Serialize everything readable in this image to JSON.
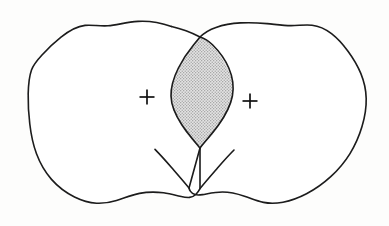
{
  "figure": {
    "title": "Two overlapping irregular regions with shaded intersection",
    "background_color": "#fdfdfc",
    "stroke_color": "#1a1a1a",
    "stroke_width": 1.6,
    "fill_color": "#ffffff",
    "intersection_fill_color": "#d8d8d8",
    "intersection_stipple_color": "#9a9a9a",
    "marker_color": "#111111",
    "width": 389,
    "height": 226
  },
  "regions": [
    {
      "id": "left-region",
      "label": "Left region",
      "center_marker": {
        "x": 147,
        "y": 97,
        "glyph": "+",
        "size": 15
      },
      "bounds": {
        "x_min": 28,
        "x_max": 233,
        "y_min": 21,
        "y_max": 205
      }
    },
    {
      "id": "right-region",
      "label": "Right region",
      "center_marker": {
        "x": 250,
        "y": 101,
        "glyph": "+",
        "size": 15
      },
      "bounds": {
        "x_min": 171,
        "x_max": 366,
        "y_min": 22,
        "y_max": 206
      }
    }
  ],
  "intersection": {
    "id": "intersection-lens",
    "label": "Shaded intersection lens",
    "shaded": true,
    "top_crossing": {
      "x": 200,
      "y": 37
    },
    "bottom_crossing": {
      "x": 200,
      "y": 148
    },
    "x_min": 171,
    "x_max": 233
  },
  "markers": [
    {
      "id": "left-center-cross",
      "name": "plus",
      "glyph": "+",
      "x": 147,
      "y": 97
    },
    {
      "id": "right-center-cross",
      "name": "plus",
      "glyph": "+",
      "x": 250,
      "y": 101
    }
  ],
  "paths": {
    "left_outline": "M 171.5 26.5 C 160 22.5 148 20.8 138 21.4 C 126 22.1 117 25.2 108 25.8 C 99 26.4 92 24.6 85 25.4 C 76 26.4 68 31.6 61 37.2 C 53.5 43.2 47 49.5 42 55.0 C 37 60.4 33.5 64.4 31.5 70.0 C 29.2 76.4 28.4 84.8 28.2 94.0 C 28.0 103.6 28.6 114.0 29.8 124.0 C 31.0 134.4 33.0 144.4 36.5 153.8 C 40.0 163.2 45.0 172.0 51.5 179.4 C 58.0 186.8 66.0 192.8 74.5 197.0 C 82.0 200.7 89.5 202.8 96.5 203.2 C 103.5 203.6 110.0 202.4 116.5 200.4 C 124.0 198.1 131.5 195.0 139.5 193.4 C 147.5 191.8 156.0 191.8 163.5 192.8 C 170.0 193.7 175.5 195.2 180.0 196.2 C 184.0 197.1 187.0 197.6 189.5 197.4 C 192.0 197.2 194.0 196.2 196.0 194.2 C 198.2 192.0 200.0 188.6 200.0 188.6 L 200.0 148.0",
    "left_lens_edge": "M 200.0 148.0 C 204.5 142.0 212.0 134.0 218.5 125.0 C 225.0 116.0 230.5 106.0 232.4 96.0 C 234.2 86.4 232.6 76.8 228.8 68.0 C 225.0 59.2 219.0 51.2 212.5 44.8 C 206.5 38.9 200.0 37.0 200.0 37.0 C 200.0 37.0 193.0 33.4 186.0 30.8 C 181.2 29.0 176.0 27.5 171.5 26.5",
    "right_outline": "M 200.0 37.0 C 204.0 33.0 209.5 29.6 216.0 27.4 C 223.5 24.8 232.0 23.4 240.5 22.9 C 249.5 22.4 258.5 22.8 267.0 23.6 C 275.5 24.4 283.5 25.6 291.0 25.6 C 298.5 25.6 305.5 24.4 312.0 25.2 C 319.0 26.0 325.5 29.0 331.5 33.6 C 337.5 38.2 343.0 44.4 348.0 51.2 C 353.0 58.0 357.5 65.4 360.8 73.4 C 364.0 81.2 366.0 89.6 366.2 98.4 C 366.4 107.6 364.8 117.2 362.0 126.6 C 359.2 136.0 355.2 145.2 350.0 153.6 C 344.8 162.0 338.4 169.6 331.0 176.4 C 323.6 183.2 315.2 189.2 306.5 193.8 C 298.5 198.0 290.5 200.8 283.0 202.2 C 276.0 203.5 269.5 203.6 263.5 202.4 C 257.0 201.1 251.0 198.4 244.5 196.2 C 237.5 193.8 230.0 192.0 222.5 192.0 C 215.0 192.0 207.5 193.8 202.5 194.6 C 199.5 195.1 197.0 195.2 195.0 194.6 C 193.0 194.0 191.5 192.8 190.5 191.4 C 189.4 189.8 189.0 188.0 189.0 188.0 L 200.0 148.0",
    "right_lens_edge": "M 200.0 148.0 C 195.0 142.0 188.0 134.0 182.0 125.0 C 176.0 116.0 171.2 106.0 171.0 96.0 C 170.8 86.4 174.0 76.8 178.4 68.0 C 182.8 59.2 188.4 51.2 193.5 45.0 C 196.8 41.0 200.0 37.0 200.0 37.0",
    "left_tail": "M 189.0 188.0 C 185.0 183.0 178.0 175.0 171.5 167.5 C 165.0 160.0 159.0 153.5 155.0 149.4",
    "right_tail": "M 200.0 188.6 C 204.0 183.5 211.0 175.5 217.5 168.0 C 224.0 160.5 230.0 154.0 234.0 150.0",
    "lens": "M 200.0 37.0 C 196.8 41.0 193.5 45.0 189.0 51.2 C 184.0 58.2 178.8 67.0 175.0 76.0 C 171.8 83.6 170.8 90.8 171.0 98.0 C 171.2 107.0 175.5 116.4 181.0 125.2 C 186.5 134.0 193.5 142.0 200.0 148.0 C 206.0 142.2 213.5 134.0 219.5 125.0 C 225.8 115.6 230.8 105.6 232.4 96.0 C 233.8 87.4 232.0 78.6 228.5 70.4 C 225.0 62.0 219.6 54.2 213.8 47.8 C 208.2 41.6 203.0 37.6 200.0 37.0 Z"
  }
}
